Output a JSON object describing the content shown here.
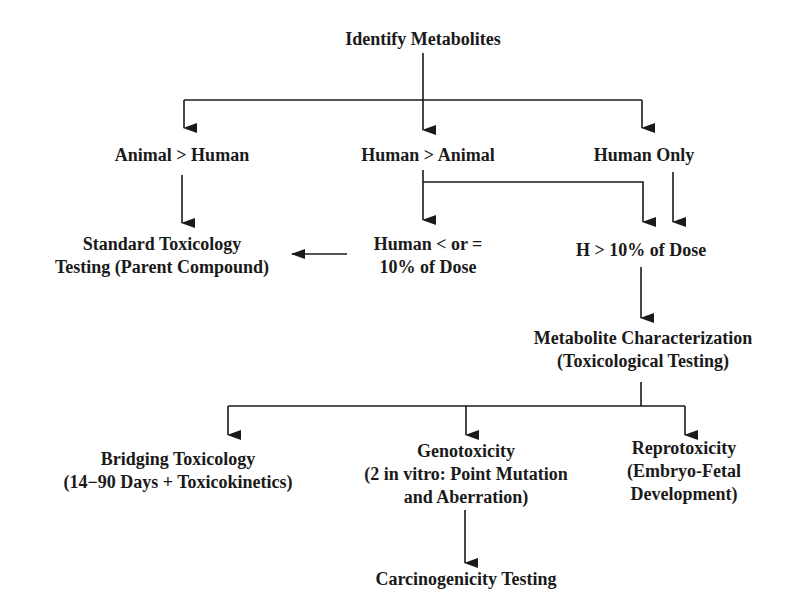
{
  "diagram": {
    "type": "flowchart",
    "nodes": {
      "identify": {
        "lines": [
          "Identify Metabolites"
        ]
      },
      "animal_gt_human": {
        "lines": [
          "Animal > Human"
        ]
      },
      "human_gt_animal": {
        "lines": [
          "Human > Animal"
        ]
      },
      "human_only": {
        "lines": [
          "Human Only"
        ]
      },
      "standard_tox": {
        "lines": [
          "Standard Toxicology",
          "Testing (Parent Compound)"
        ]
      },
      "human_le_10": {
        "lines": [
          "Human < or =",
          "10% of Dose"
        ]
      },
      "h_gt_10": {
        "lines": [
          "H > 10% of Dose"
        ]
      },
      "metabolite_char": {
        "lines": [
          "Metabolite Characterization",
          "(Toxicological Testing)"
        ]
      },
      "bridging": {
        "lines": [
          "Bridging Toxicology",
          "(14−90 Days + Toxicokinetics)"
        ]
      },
      "genotox": {
        "lines": [
          "Genotoxicity",
          "(2 in vitro: Point Mutation",
          "and Aberration)"
        ]
      },
      "reprotox": {
        "lines": [
          "Reprotoxicity",
          "(Embryo-Fetal",
          "Development)"
        ]
      },
      "carcino": {
        "lines": [
          "Carcinogenicity Testing"
        ]
      }
    },
    "edges": [
      {
        "from": "identify",
        "to": "animal_gt_human"
      },
      {
        "from": "identify",
        "to": "human_gt_animal"
      },
      {
        "from": "identify",
        "to": "human_only"
      },
      {
        "from": "animal_gt_human",
        "to": "standard_tox"
      },
      {
        "from": "human_gt_animal",
        "to": "human_le_10"
      },
      {
        "from": "human_gt_animal",
        "to": "h_gt_10"
      },
      {
        "from": "human_only",
        "to": "h_gt_10"
      },
      {
        "from": "human_le_10",
        "to": "standard_tox"
      },
      {
        "from": "h_gt_10",
        "to": "metabolite_char"
      },
      {
        "from": "metabolite_char",
        "to": "bridging"
      },
      {
        "from": "metabolite_char",
        "to": "genotox"
      },
      {
        "from": "metabolite_char",
        "to": "reprotox"
      },
      {
        "from": "genotox",
        "to": "carcino"
      }
    ],
    "colors": {
      "line": "#1a1a1a",
      "text": "#1a1a1a",
      "background": "#ffffff"
    }
  }
}
